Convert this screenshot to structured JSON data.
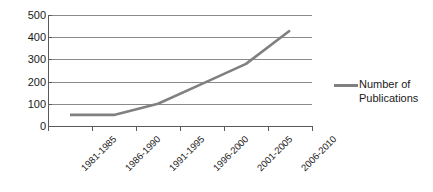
{
  "chart_data": {
    "type": "line",
    "title": "",
    "xlabel": "",
    "ylabel": "",
    "categories": [
      "1981-1985",
      "1986-1990",
      "1991-1995",
      "1996-2000",
      "2001-2005",
      "2006-2010"
    ],
    "series": [
      {
        "name": "Number of Publications",
        "values": [
          50,
          50,
          100,
          190,
          280,
          430
        ],
        "color": "#808080"
      }
    ],
    "ylim": [
      0,
      500
    ],
    "yticks": [
      0,
      100,
      200,
      300,
      400,
      500
    ],
    "ytick_labels": [
      "0",
      "100",
      "200",
      "300",
      "400",
      "500"
    ],
    "grid": true,
    "grid_axis": "y",
    "legend_position": "right",
    "legend_entries": [
      {
        "label_line1": "Number of",
        "label_line2": "Publications",
        "color": "#808080"
      }
    ]
  },
  "colors": {
    "series": "#808080",
    "grid": "#8a8a8a",
    "axis": "#5a5a5a",
    "text": "#1a1a1a",
    "background": "#ffffff"
  }
}
